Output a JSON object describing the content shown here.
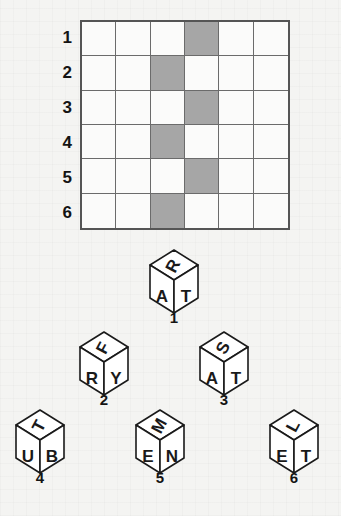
{
  "puzzle": {
    "grid": {
      "rows": 6,
      "columns": 6,
      "row_labels": [
        "1",
        "2",
        "3",
        "4",
        "5",
        "6"
      ],
      "shaded_color": "#a6a6a6",
      "line_color": "#6b6b6b",
      "border_color": "#555555",
      "shaded_cells": [
        {
          "row": 1,
          "col": 4
        },
        {
          "row": 2,
          "col": 3
        },
        {
          "row": 3,
          "col": 4
        },
        {
          "row": 4,
          "col": 3
        },
        {
          "row": 5,
          "col": 4
        },
        {
          "row": 6,
          "col": 3
        }
      ]
    },
    "cubes": [
      {
        "number": "1",
        "top": "R",
        "left": "A",
        "right": "T",
        "x": 138,
        "y": 248
      },
      {
        "number": "2",
        "top": "F",
        "left": "R",
        "right": "Y",
        "x": 68,
        "y": 330
      },
      {
        "number": "3",
        "top": "S",
        "left": "A",
        "right": "T",
        "x": 188,
        "y": 330
      },
      {
        "number": "4",
        "top": "T",
        "left": "U",
        "right": "B",
        "x": 4,
        "y": 408
      },
      {
        "number": "5",
        "top": "M",
        "left": "E",
        "right": "N",
        "x": 124,
        "y": 408
      },
      {
        "number": "6",
        "top": "L",
        "left": "E",
        "right": "T",
        "x": 258,
        "y": 408
      }
    ]
  }
}
